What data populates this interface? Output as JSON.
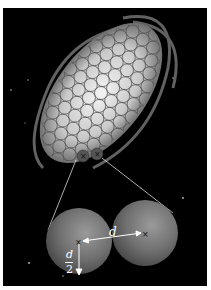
{
  "figure": {
    "labels": {
      "distance": "d",
      "radius_numerator": "d",
      "radius_denominator": "2"
    },
    "colors": {
      "background": "#000000",
      "page": "#ffffff",
      "sphere": "#6e6e6e",
      "annotation": "#ffffff",
      "connector": "#d8d8d8"
    },
    "grid": {
      "cell_count_approx": 110
    }
  }
}
